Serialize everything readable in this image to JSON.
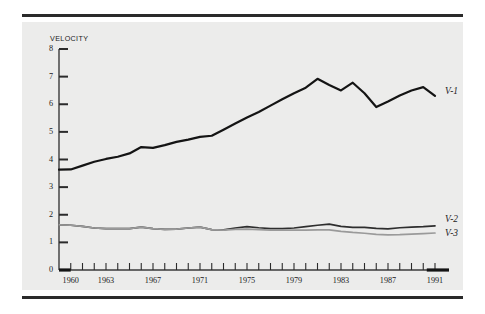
{
  "figure": {
    "background": "#ffffff",
    "panel_background": "#ececeb",
    "rule_color": "#2a2a2a"
  },
  "chart_data": {
    "type": "line",
    "title": "",
    "subtitle": "",
    "xlabel": "",
    "ylabel": "VELOCITY",
    "xlim": [
      1959,
      1991
    ],
    "ylim": [
      0,
      8
    ],
    "grid": false,
    "legend_position": "right-inline",
    "ytick_labels": [
      "8",
      "7",
      "6",
      "5",
      "4",
      "3",
      "2",
      "1",
      "0"
    ],
    "ytick_values": [
      8,
      7,
      6,
      5,
      4,
      3,
      2,
      1,
      0
    ],
    "xtick_labels": [
      "1960",
      "1963",
      "1967",
      "1971",
      "1975",
      "1979",
      "1983",
      "1987",
      "1991"
    ],
    "xtick_values": [
      1960,
      1963,
      1967,
      1971,
      1975,
      1979,
      1983,
      1987,
      1991
    ],
    "x": [
      1959,
      1960,
      1961,
      1962,
      1963,
      1964,
      1965,
      1966,
      1967,
      1968,
      1969,
      1970,
      1971,
      1972,
      1973,
      1974,
      1975,
      1976,
      1977,
      1978,
      1979,
      1980,
      1981,
      1982,
      1983,
      1984,
      1985,
      1986,
      1987,
      1988,
      1989,
      1990,
      1991
    ],
    "series": [
      {
        "name": "V-1",
        "color": "#141414",
        "width": 2.2,
        "label": "V-1",
        "values": [
          3.63,
          3.64,
          3.78,
          3.92,
          4.02,
          4.1,
          4.22,
          4.45,
          4.42,
          4.52,
          4.64,
          4.72,
          4.82,
          4.86,
          5.08,
          5.3,
          5.52,
          5.72,
          5.95,
          6.18,
          6.4,
          6.6,
          6.92,
          6.7,
          6.5,
          6.78,
          6.4,
          5.9,
          6.1,
          6.32,
          6.5,
          6.62,
          6.3
        ]
      },
      {
        "name": "V-2",
        "color": "#2e2e2e",
        "width": 1.7,
        "label": "V-2",
        "values": [
          1.63,
          1.62,
          1.58,
          1.52,
          1.5,
          1.5,
          1.5,
          1.55,
          1.5,
          1.47,
          1.48,
          1.52,
          1.55,
          1.46,
          1.45,
          1.52,
          1.57,
          1.53,
          1.5,
          1.5,
          1.52,
          1.57,
          1.62,
          1.66,
          1.58,
          1.54,
          1.54,
          1.51,
          1.49,
          1.53,
          1.55,
          1.57,
          1.6
        ]
      },
      {
        "name": "V-3",
        "color": "#9a9a9a",
        "width": 1.7,
        "label": "V-3",
        "values": [
          1.63,
          1.62,
          1.58,
          1.52,
          1.5,
          1.5,
          1.5,
          1.55,
          1.5,
          1.47,
          1.48,
          1.52,
          1.55,
          1.46,
          1.44,
          1.47,
          1.48,
          1.46,
          1.44,
          1.44,
          1.44,
          1.44,
          1.45,
          1.45,
          1.4,
          1.36,
          1.33,
          1.29,
          1.27,
          1.28,
          1.3,
          1.32,
          1.34
        ]
      }
    ]
  }
}
